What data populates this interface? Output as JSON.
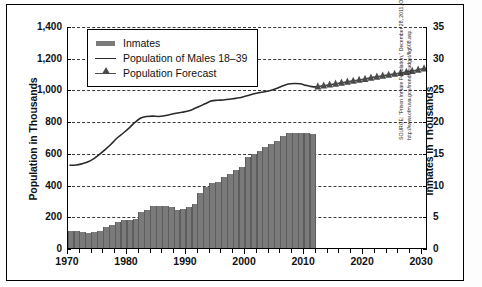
{
  "chart_data": {
    "type": "bar",
    "title": "",
    "xlabel": "",
    "ylabel": "Population in Thousands",
    "y2label": "Inmates in Thousands",
    "xlim": [
      1970,
      2031
    ],
    "ylim": [
      0,
      1400
    ],
    "y2lim": [
      0,
      35
    ],
    "grid": true,
    "legend_position": "upper-left",
    "y_ticks": [
      "0",
      "200",
      "400",
      "600",
      "800",
      "1,000",
      "1,200",
      "1,400"
    ],
    "y_tick_values": [
      0,
      200,
      400,
      600,
      800,
      1000,
      1200,
      1400
    ],
    "y2_ticks": [
      "0",
      "5",
      "10",
      "15",
      "20",
      "25",
      "30",
      "35"
    ],
    "y2_tick_values": [
      0,
      5,
      10,
      15,
      20,
      25,
      30,
      35
    ],
    "x_ticks": [
      "1970",
      "1980",
      "1990",
      "2000",
      "2010",
      "2020",
      "2030"
    ],
    "x_tick_values": [
      1970,
      1980,
      1990,
      2000,
      2010,
      2020,
      2030
    ],
    "x_minor_interval": 2,
    "series": [
      {
        "name": "Inmates",
        "type": "bar",
        "axis": "right",
        "color": "#7a7a7a",
        "x": [
          1970,
          1971,
          1972,
          1973,
          1974,
          1975,
          1976,
          1977,
          1978,
          1979,
          1980,
          1981,
          1982,
          1983,
          1984,
          1985,
          1986,
          1987,
          1988,
          1989,
          1990,
          1991,
          1992,
          1993,
          1994,
          1995,
          1996,
          1997,
          1998,
          1999,
          2000,
          2001,
          2002,
          2003,
          2004,
          2005,
          2006,
          2007,
          2008,
          2009,
          2010,
          2011
        ],
        "values_left_scale": [
          113,
          113,
          108,
          100,
          108,
          116,
          136,
          152,
          170,
          180,
          184,
          190,
          232,
          248,
          272,
          272,
          270,
          265,
          248,
          250,
          262,
          287,
          352,
          394,
          414,
          420,
          456,
          476,
          496,
          520,
          580,
          600,
          620,
          646,
          660,
          680,
          712,
          730,
          733,
          733,
          730,
          727
        ],
        "values_right_scale": [
          2.8,
          2.8,
          2.7,
          2.5,
          2.7,
          2.9,
          3.4,
          3.8,
          4.25,
          4.5,
          4.6,
          4.75,
          5.8,
          6.2,
          6.8,
          6.8,
          6.75,
          6.63,
          6.2,
          6.25,
          6.55,
          7.18,
          8.8,
          9.85,
          10.35,
          10.5,
          11.4,
          11.9,
          12.4,
          13.0,
          14.5,
          15.0,
          15.5,
          16.15,
          16.5,
          17.0,
          17.8,
          18.25,
          18.33,
          18.33,
          18.25,
          18.18
        ]
      },
      {
        "name": "Population of Males 18–39",
        "type": "line",
        "axis": "left",
        "color": "#2a2a2a",
        "x": [
          1970,
          1971,
          1972,
          1973,
          1974,
          1975,
          1976,
          1977,
          1978,
          1979,
          1980,
          1981,
          1982,
          1983,
          1984,
          1985,
          1986,
          1987,
          1988,
          1989,
          1990,
          1991,
          1992,
          1993,
          1994,
          1995,
          1996,
          1997,
          1998,
          1999,
          2000,
          2001,
          2002,
          2003,
          2004,
          2005,
          2006,
          2007,
          2008,
          2009,
          2010,
          2011,
          2012
        ],
        "values": [
          528,
          530,
          537,
          548,
          568,
          596,
          628,
          662,
          700,
          730,
          762,
          798,
          826,
          836,
          838,
          836,
          840,
          848,
          856,
          862,
          870,
          884,
          900,
          918,
          934,
          938,
          940,
          944,
          950,
          956,
          966,
          978,
          986,
          992,
          1000,
          1012,
          1028,
          1040,
          1044,
          1042,
          1032,
          1024,
          1022
        ]
      },
      {
        "name": "Population Forecast",
        "type": "line-marker",
        "axis": "left",
        "color": "#4a4a4a",
        "marker": "triangle",
        "x": [
          2012,
          2013,
          2014,
          2015,
          2016,
          2017,
          2018,
          2019,
          2020,
          2021,
          2022,
          2023,
          2024,
          2025,
          2026,
          2027,
          2028,
          2029,
          2030
        ],
        "values": [
          1024,
          1030,
          1036,
          1042,
          1048,
          1054,
          1060,
          1066,
          1072,
          1080,
          1086,
          1092,
          1098,
          1104,
          1110,
          1116,
          1122,
          1130,
          1138
        ]
      }
    ]
  },
  "legend": {
    "items": [
      {
        "label": "Inmates",
        "key": "bar-swatch"
      },
      {
        "label": "Population of Males 18–39",
        "key": "line-swatch"
      },
      {
        "label": "Population Forecast",
        "key": "forecast-swatch"
      }
    ]
  },
  "source": {
    "text": "SOURCE: \"Prison Inmate Population,\" December 28, 2011, Office of Financial Management, Washington. From http://www.ofm.wa.gov/trends/budget/fig608.asp."
  }
}
